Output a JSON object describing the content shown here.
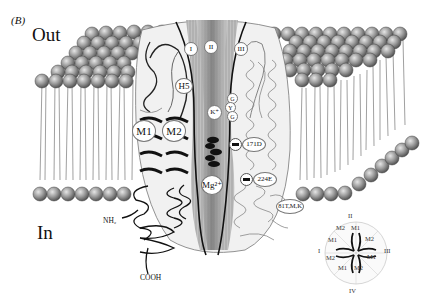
{
  "figure": {
    "panel_label": "(B)",
    "region_labels": {
      "outside": "Out",
      "inside": "In"
    },
    "termini": {
      "n_terminus": "NH₂",
      "c_terminus": "COOH"
    },
    "subunits": [
      "I",
      "II",
      "III"
    ],
    "helices": {
      "h5": "H5",
      "m1": "M1",
      "m2": "M2"
    },
    "selectivity_filter": [
      "G",
      "Y",
      "G"
    ],
    "ions": {
      "potassium": "K⁺",
      "magnesium": "Mg²⁺"
    },
    "residues": {
      "r171": "171D",
      "r224": "224E",
      "r81": "81T,M,K"
    },
    "top_view_wheel": {
      "subunit_labels": [
        "II",
        "III",
        "IV",
        "I"
      ],
      "helix_labels": [
        "M2",
        "M1",
        "M2",
        "M1",
        "M2",
        "M1",
        "M2",
        "M1"
      ]
    }
  }
}
